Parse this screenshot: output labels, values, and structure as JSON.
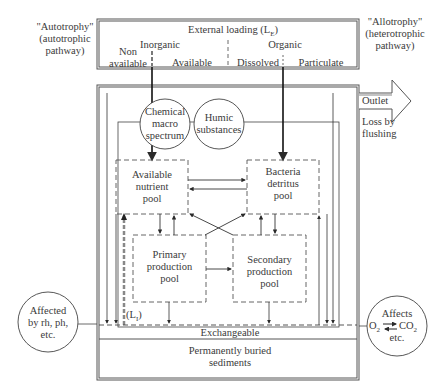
{
  "left_label": {
    "line1": "\"Autotrophy\"",
    "line2": "(autotrophic",
    "line3": "pathway)"
  },
  "right_label": {
    "line1": "\"Allotrophy\"",
    "line2": "(heterotrophic",
    "line3": "pathway)"
  },
  "external_loading": {
    "title": "External loading (L",
    "title_sub": "E",
    "title_end": ")",
    "inorganic": "Inorganic",
    "organic": "Organic",
    "non_available_1": "Non",
    "non_available_2": "available",
    "available": "Available",
    "dissolved": "Dissolved",
    "particulate": "Particulate"
  },
  "outlet": {
    "label": "Outlet",
    "loss_1": "Loss by",
    "loss_2": "flushing"
  },
  "circles": {
    "chemical": {
      "l1": "Chemical",
      "l2": "macro",
      "l3": "spectrum"
    },
    "humic": {
      "l1": "Humic",
      "l2": "substances"
    },
    "affected": {
      "l1": "Affected",
      "l2": "by rh, ph,",
      "l3": "etc."
    },
    "affects": {
      "l1": "Affects",
      "o2": "O",
      "co2": "CO",
      "l3": "etc."
    }
  },
  "pools": {
    "available_nutrient": {
      "l1": "Available",
      "l2": "nutrient",
      "l3": "pool"
    },
    "bacteria_detritus": {
      "l1": "Bacteria",
      "l2": "detritus",
      "l3": "pool"
    },
    "primary": {
      "l1": "Primary",
      "l2": "production",
      "l3": "pool"
    },
    "secondary": {
      "l1": "Secondary",
      "l2": "production",
      "l3": "pool"
    }
  },
  "internal_loading": {
    "label": "(L",
    "sub": "I",
    "end": ")"
  },
  "sediments": {
    "exchangeable": "Exchangeable",
    "buried_1": "Permanently buried",
    "buried_2": "sediments"
  },
  "colors": {
    "line": "#2a2a2a",
    "frame": "#555555",
    "text": "#3a3a3a"
  }
}
